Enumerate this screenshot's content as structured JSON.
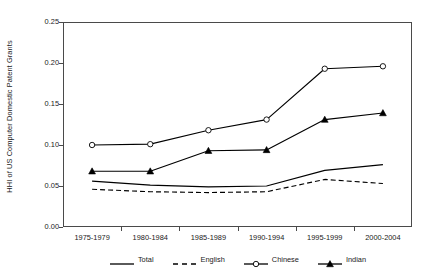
{
  "chart_data": {
    "type": "line",
    "title": "",
    "subtitle": "",
    "xlabel": "",
    "ylabel": "HHI of US Computer Domestic Patent Grants",
    "categories": [
      "1975-1979",
      "1980-1984",
      "1985-1989",
      "1990-1994",
      "1995-1999",
      "2000-2004"
    ],
    "ylim": [
      0.0,
      0.25
    ],
    "ytick_labels": [
      "0.00",
      "0.05",
      "0.10",
      "0.15",
      "0.20",
      "0.25"
    ],
    "ytick_values": [
      0.0,
      0.05,
      0.1,
      0.15,
      0.2,
      0.25
    ],
    "grid": false,
    "legend_position": "bottom",
    "series": [
      {
        "name": "Total",
        "style": "solid",
        "marker": "none",
        "color": "#000000",
        "values": [
          0.056,
          0.051,
          0.049,
          0.05,
          0.069,
          0.076
        ]
      },
      {
        "name": "English",
        "style": "dashed",
        "marker": "none",
        "color": "#000000",
        "values": [
          0.046,
          0.043,
          0.042,
          0.043,
          0.058,
          0.053
        ]
      },
      {
        "name": "Chinese",
        "style": "solid",
        "marker": "open-circle",
        "color": "#000000",
        "values": [
          0.1,
          0.101,
          0.118,
          0.131,
          0.193,
          0.196
        ]
      },
      {
        "name": "Indian",
        "style": "solid",
        "marker": "filled-triangle",
        "color": "#000000",
        "values": [
          0.068,
          0.068,
          0.093,
          0.094,
          0.131,
          0.139
        ]
      }
    ]
  },
  "legend": {
    "items": [
      {
        "label": "Total"
      },
      {
        "label": "English"
      },
      {
        "label": "Chinese"
      },
      {
        "label": "Indian"
      }
    ]
  }
}
